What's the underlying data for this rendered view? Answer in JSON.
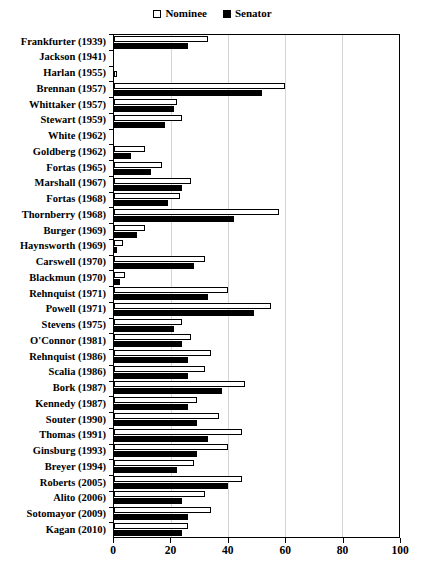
{
  "chart_data": {
    "type": "bar",
    "orientation": "horizontal",
    "title": "",
    "xlabel": "",
    "ylabel": "",
    "xlim": [
      0,
      100
    ],
    "xticks": [
      0,
      20,
      40,
      60,
      80,
      100
    ],
    "grid": true,
    "legend_position": "top-center",
    "legend": [
      {
        "name": "Nominee",
        "swatch": "open-square",
        "color": "#ffffff"
      },
      {
        "name": "Senator",
        "swatch": "filled-square",
        "color": "#000000"
      }
    ],
    "categories": [
      "Frankfurter (1939)",
      "Jackson (1941)",
      "Harlan (1955)",
      "Brennan (1957)",
      "Whittaker (1957)",
      "Stewart (1959)",
      "White (1962)",
      "Goldberg (1962)",
      "Fortas (1965)",
      "Marshall (1967)",
      "Fortas (1968)",
      "Thornberry (1968)",
      "Burger (1969)",
      "Haynsworth (1969)",
      "Carswell (1970)",
      "Blackmun (1970)",
      "Rehnquist (1971)",
      "Powell (1971)",
      "Stevens (1975)",
      "O'Connor (1981)",
      "Rehnquist (1986)",
      "Scalia (1986)",
      "Bork (1987)",
      "Kennedy (1987)",
      "Souter (1990)",
      "Thomas (1991)",
      "Ginsburg (1993)",
      "Breyer (1994)",
      "Roberts (2005)",
      "Alito (2006)",
      "Sotomayor (2009)",
      "Kagan (2010)"
    ],
    "series": [
      {
        "name": "Nominee",
        "values": [
          33,
          0,
          1,
          60,
          22,
          24,
          0,
          11,
          17,
          27,
          23,
          58,
          11,
          3,
          32,
          4,
          40,
          55,
          24,
          27,
          34,
          32,
          46,
          29,
          37,
          45,
          40,
          28,
          45,
          32,
          34,
          26
        ]
      },
      {
        "name": "Senator",
        "values": [
          26,
          0,
          0,
          52,
          21,
          18,
          0,
          6,
          13,
          24,
          19,
          42,
          8,
          1,
          28,
          2,
          33,
          49,
          21,
          24,
          26,
          26,
          38,
          26,
          29,
          33,
          29,
          22,
          40,
          24,
          26,
          24
        ]
      }
    ]
  },
  "axis": {
    "x_tick_labels": [
      "0",
      "20",
      "40",
      "60",
      "80",
      "100"
    ]
  }
}
